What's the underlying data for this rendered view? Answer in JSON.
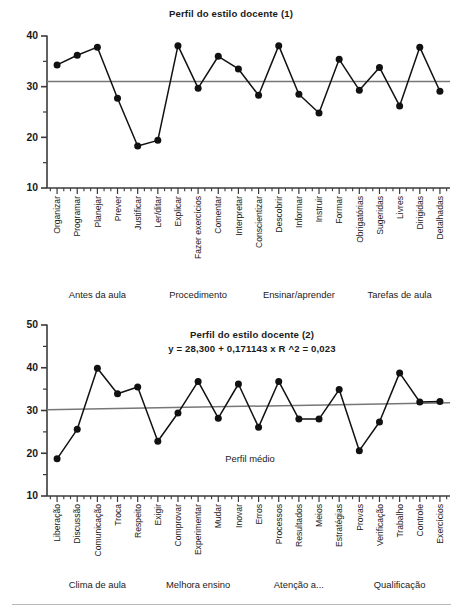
{
  "figure": {
    "width": 463,
    "height": 612,
    "background": "#ffffff",
    "ink_color": "#111111",
    "mean_line_color": "#777777",
    "axis_color": "#3a3a3a"
  },
  "chart_data": [
    {
      "type": "line",
      "id": "perfil-1",
      "title": "Perfil do estilo docente (1)",
      "xlabel": "",
      "ylabel": "",
      "ylim": [
        10,
        40
      ],
      "yticks": [
        10,
        20,
        30,
        40
      ],
      "ytick_labels": [
        "10",
        "20",
        "30",
        "40"
      ],
      "grid": false,
      "legend": "none",
      "mean_line": 31.0,
      "categories": [
        "Organizar",
        "Programar",
        "Planejar",
        "Prever",
        "Justificar",
        "Ler/ditar",
        "Explicar",
        "Fazer exercícios",
        "Comentar",
        "Interpretar",
        "Conscientizar",
        "Descobrir",
        "Informar",
        "Instruir",
        "Formar",
        "Obrigatórias",
        "Sugeridas",
        "Livres",
        "Dirigidas",
        "Detalhadas"
      ],
      "values": [
        34.3,
        36.2,
        37.8,
        27.7,
        18.3,
        19.4,
        38.1,
        29.7,
        36.0,
        33.5,
        28.3,
        38.1,
        28.5,
        24.8,
        35.4,
        29.3,
        33.8,
        26.2,
        37.8,
        29.1
      ],
      "groups": [
        {
          "label": "Antes da aula",
          "from": 0,
          "to": 4
        },
        {
          "label": "Procedimento",
          "from": 5,
          "to": 9
        },
        {
          "label": "Ensinar/aprender",
          "from": 10,
          "to": 14
        },
        {
          "label": "Tarefas de aula",
          "from": 15,
          "to": 19
        }
      ]
    },
    {
      "type": "line",
      "id": "perfil-2",
      "title": "Perfil do estilo docente (2)",
      "annotation": "y = 28,300 + 0,171143 x R  ^2 = 0,023",
      "mean_label": "Perfil médio",
      "xlabel": "",
      "ylabel": "",
      "ylim": [
        10,
        50
      ],
      "yticks": [
        10,
        20,
        30,
        40,
        50
      ],
      "ytick_labels": [
        "10",
        "20",
        "30",
        "40",
        "50"
      ],
      "grid": false,
      "legend": "none",
      "trend_start": 30.2,
      "trend_end": 31.8,
      "categories": [
        "Liberação",
        "Discussão",
        "Comunicação",
        "Troca",
        "Respeito",
        "Exigir",
        "Comprovar",
        "Experimentar",
        "Mudar",
        "Inovar",
        "Erros",
        "Processos",
        "Resultados",
        "Meios",
        "Estratégias",
        "Provas",
        "Verificação",
        "Trabalho",
        "Controle",
        "Exercícios"
      ],
      "values": [
        18.7,
        25.6,
        39.9,
        33.9,
        35.5,
        22.8,
        29.4,
        36.8,
        28.2,
        36.2,
        26.1,
        36.8,
        28.0,
        28.0,
        34.9,
        20.6,
        27.3,
        38.8,
        32.0,
        32.1
      ],
      "groups": [
        {
          "label": "Clima de aula",
          "from": 0,
          "to": 4
        },
        {
          "label": "Melhora ensino",
          "from": 5,
          "to": 9
        },
        {
          "label": "Atenção a...",
          "from": 10,
          "to": 14
        },
        {
          "label": "Qualificação",
          "from": 15,
          "to": 19
        }
      ]
    }
  ]
}
